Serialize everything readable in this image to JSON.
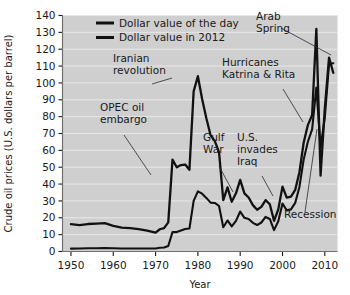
{
  "chart_data": {
    "type": "line",
    "title": "",
    "xlabel": "Year",
    "ylabel": "Crude oil prices (U.S. dollars per barrel)",
    "xlim": [
      1948,
      2013
    ],
    "ylim": [
      0,
      140
    ],
    "xticks": [
      1950,
      1960,
      1970,
      1980,
      1990,
      2000,
      2010
    ],
    "yticks": [
      0,
      10,
      20,
      30,
      40,
      50,
      60,
      70,
      80,
      90,
      100,
      110,
      120,
      130,
      140
    ],
    "grid": "horizontal",
    "legend_position": "top-center",
    "plot_background": "#cfcfcf",
    "line_color": "#111111",
    "series": [
      {
        "name": "Dollar value of the day",
        "x": [
          1950,
          1952,
          1954,
          1956,
          1958,
          1960,
          1962,
          1964,
          1966,
          1968,
          1970,
          1971,
          1972,
          1973,
          1974,
          1975,
          1976,
          1977,
          1978,
          1979,
          1980,
          1981,
          1982,
          1983,
          1984,
          1985,
          1986,
          1987,
          1988,
          1989,
          1990,
          1991,
          1992,
          1993,
          1994,
          1995,
          1996,
          1997,
          1998,
          1999,
          2000,
          2001,
          2002,
          2003,
          2004,
          2005,
          2006,
          2007,
          2008,
          2009,
          2010,
          2011,
          2012
        ],
        "values": [
          1.7,
          1.8,
          1.9,
          1.9,
          2.1,
          1.9,
          1.8,
          1.8,
          1.8,
          1.8,
          1.8,
          2.2,
          2.4,
          3.3,
          11.6,
          11.5,
          12.4,
          13.3,
          13.6,
          30.0,
          35.7,
          34.3,
          31.8,
          29.0,
          28.8,
          27.0,
          14.4,
          18.4,
          14.9,
          18.2,
          23.7,
          20.0,
          19.3,
          17.0,
          15.7,
          17.2,
          20.5,
          19.3,
          12.7,
          17.9,
          28.5,
          24.4,
          25.0,
          28.8,
          38.3,
          54.5,
          65.1,
          72.4,
          97.3,
          61.7,
          79.5,
          111.3,
          111.7
        ]
      },
      {
        "name": "Dollar value in 2012",
        "x": [
          1950,
          1952,
          1954,
          1956,
          1958,
          1960,
          1962,
          1964,
          1966,
          1968,
          1970,
          1971,
          1972,
          1973,
          1974,
          1975,
          1976,
          1977,
          1978,
          1979,
          1980,
          1981,
          1982,
          1983,
          1984,
          1985,
          1986,
          1987,
          1988,
          1989,
          1990,
          1991,
          1992,
          1993,
          1994,
          1995,
          1996,
          1997,
          1998,
          1999,
          2000,
          2001,
          2002,
          2003,
          2004,
          2005,
          2006,
          2007,
          2008,
          2009,
          2010,
          2011,
          2012
        ],
        "values": [
          16.2,
          15.7,
          16.3,
          16.5,
          16.8,
          15.2,
          14.2,
          13.9,
          13.3,
          12.4,
          11.2,
          13.2,
          13.9,
          17.3,
          54.5,
          50.0,
          51.3,
          51.6,
          48.5,
          95.0,
          104.0,
          90.5,
          79.0,
          69.0,
          65.5,
          59.0,
          30.5,
          38.0,
          29.5,
          34.5,
          42.5,
          34.5,
          32.0,
          27.5,
          24.8,
          26.5,
          30.5,
          28.0,
          18.2,
          25.0,
          38.5,
          32.0,
          32.5,
          36.5,
          47.0,
          64.5,
          75.0,
          81.0,
          132.0,
          45.0,
          85.0,
          115.0,
          106.0
        ]
      }
    ],
    "annotations": [
      {
        "text": "OPEC oil embargo",
        "lines": [
          "OPEC oil",
          "embargo"
        ],
        "label_x": 100,
        "label_y": 111,
        "leader": [
          [
            124,
            135
          ],
          [
            151,
            175
          ]
        ]
      },
      {
        "text": "Iranian revolution",
        "lines": [
          "Iranian",
          "revolution"
        ],
        "label_x": 113,
        "label_y": 62,
        "leader": [
          [
            152,
            84
          ],
          [
            172,
            78
          ]
        ]
      },
      {
        "text": "Gulf War",
        "lines": [
          "Gulf",
          "War"
        ],
        "label_x": 203,
        "label_y": 141,
        "leader": [
          [
            219,
            166
          ],
          [
            233,
            192
          ]
        ]
      },
      {
        "text": "U.S. invades Iraq",
        "lines": [
          "U.S.",
          "invades",
          "Iraq"
        ],
        "label_x": 237,
        "label_y": 141,
        "leader": [
          [
            262,
            176
          ],
          [
            273,
            196
          ]
        ]
      },
      {
        "text": "Hurricanes Katrina & Rita",
        "lines": [
          "Hurricanes",
          "Katrina & Rita"
        ],
        "label_x": 222,
        "label_y": 66,
        "leader": [
          [
            283,
            89
          ],
          [
            303,
            122
          ]
        ]
      },
      {
        "text": "Arab Spring",
        "lines": [
          "Arab",
          "Spring"
        ],
        "label_x": 256,
        "label_y": 20,
        "leader": [
          [
            281,
            28
          ],
          [
            331,
            55
          ]
        ]
      },
      {
        "text": "Recession",
        "lines": [
          "Recession"
        ],
        "label_x": 284,
        "label_y": 218,
        "leader": [
          [
            305,
            212
          ],
          [
            317,
            129
          ]
        ]
      }
    ]
  },
  "legend": {
    "items": [
      {
        "label": "Dollar value of the day"
      },
      {
        "label": "Dollar value in 2012"
      }
    ]
  },
  "axis": {
    "y_title": "Crude oil prices (U.S. dollars per barrel)",
    "x_title": "Year",
    "y_tick_labels": [
      "140",
      "130",
      "120",
      "110",
      "100",
      "90",
      "80",
      "70",
      "60",
      "50",
      "40",
      "30",
      "20",
      "10",
      "0"
    ],
    "x_tick_labels": [
      "1950",
      "1960",
      "1970",
      "1980",
      "1990",
      "2000",
      "2010"
    ]
  },
  "colors": {
    "plot_bg": "#cfcfcf",
    "line": "#111111",
    "gridline": "#e8e8e8",
    "text": "#1a1a1a",
    "page_bg": "#ffffff"
  }
}
